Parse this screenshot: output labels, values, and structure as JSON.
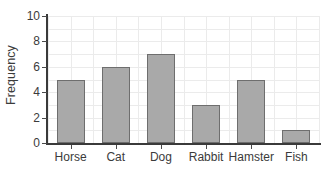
{
  "chart_data": {
    "type": "bar",
    "title": "",
    "xlabel": "",
    "ylabel": "Frequency",
    "categories": [
      "Horse",
      "Cat",
      "Dog",
      "Rabbit",
      "Hamster",
      "Fish"
    ],
    "values": [
      5,
      6,
      7,
      3,
      5,
      1
    ],
    "ylim": [
      0,
      10
    ],
    "yticks": [
      0,
      2,
      4,
      6,
      8,
      10
    ],
    "ytick_labels": [
      "0",
      "2",
      "4",
      "6",
      "8",
      "10"
    ],
    "grid": true,
    "legend": "none",
    "bar_color": "#a9a9a9",
    "bar_edge_color": "#6e6e6e",
    "grid_color": "#ebebeb",
    "axis_color": "#3a3a3a",
    "text_color": "#3b3b3b",
    "background": "#ffffff"
  }
}
